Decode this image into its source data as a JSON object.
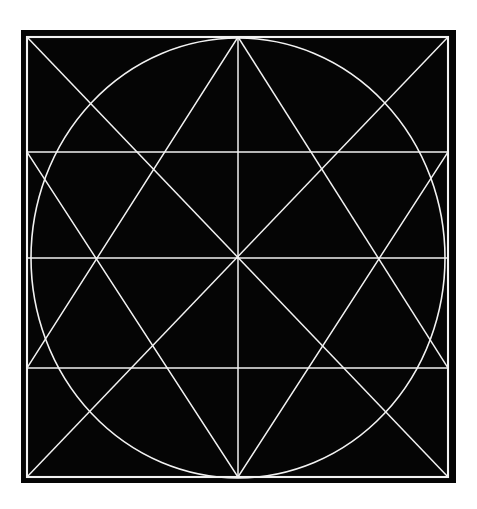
{
  "document": {
    "title": "Geometric Construction Plate",
    "background_color": "#ffffff",
    "width": 477,
    "height": 509
  },
  "figure": {
    "name": "square-circle-star-construction",
    "plate": {
      "fill_color": "#050505",
      "x": 21,
      "y": 30,
      "width": 435,
      "height": 453
    },
    "stroke_color": "#f2f2f2",
    "stroke_width_outer": 2.1,
    "stroke_width_inner": 1.5,
    "stroke_width_circle": 1.6,
    "square": {
      "left": 27,
      "top": 37,
      "right": 448,
      "bottom": 477,
      "width": 421,
      "height": 440
    },
    "center": {
      "x": 238,
      "y": 258
    },
    "circle": {
      "cx": 238,
      "cy": 258,
      "rx": 207,
      "ry": 220
    },
    "vertical_axis_x": 238,
    "horizontal_lines_y": [
      152,
      258,
      368
    ],
    "apex_top": {
      "x": 238,
      "y": 37
    },
    "apex_bottom": {
      "x": 238,
      "y": 477
    },
    "node_left_upper": {
      "x": 27,
      "y": 152
    },
    "node_right_upper": {
      "x": 448,
      "y": 152
    },
    "node_left_mid": {
      "x": 27,
      "y": 258
    },
    "node_right_mid": {
      "x": 448,
      "y": 258
    },
    "node_left_lower": {
      "x": 27,
      "y": 368
    },
    "node_right_lower": {
      "x": 448,
      "y": 368
    },
    "corner_top_left": {
      "x": 27,
      "y": 37
    },
    "corner_top_right": {
      "x": 448,
      "y": 37
    },
    "corner_bottom_left": {
      "x": 27,
      "y": 477
    },
    "corner_bottom_right": {
      "x": 448,
      "y": 477
    }
  }
}
